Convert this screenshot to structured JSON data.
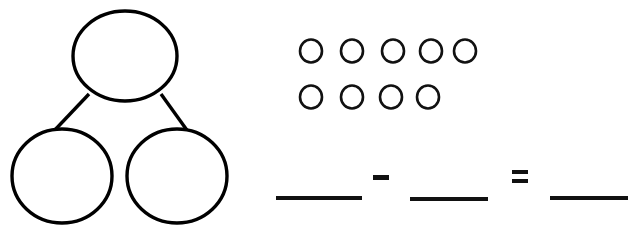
{
  "worksheet": {
    "title": "Number bond and subtraction sentence",
    "background_color": "#ffffff",
    "ink_color": "#000000",
    "width": 632,
    "height": 242
  },
  "number_bond": {
    "name": "number-bond",
    "description": "Number bond with one whole circle on top and two part circles below, all blank",
    "whole": {
      "label": "",
      "placeholder": "",
      "cx": 125,
      "cy": 56,
      "rx": 52,
      "ry": 45
    },
    "parts": [
      {
        "label": "",
        "placeholder": "",
        "cx": 62,
        "cy": 176,
        "rx": 50,
        "ry": 47
      },
      {
        "label": "",
        "placeholder": "",
        "cx": 177,
        "cy": 176,
        "rx": 50,
        "ry": 47
      }
    ],
    "connectors": [
      {
        "x1": 89,
        "y1": 94,
        "x2": 52,
        "y2": 133
      },
      {
        "x1": 161,
        "y1": 94,
        "x2": 189,
        "y2": 133
      }
    ]
  },
  "counters": {
    "name": "counter-group",
    "total_count": 9,
    "total_label": "9",
    "shape": "circle",
    "rows": [
      {
        "count": 5,
        "count_label": "5",
        "cy": 51,
        "rx": 11,
        "ry": 11.5,
        "cxs": [
          311,
          352,
          393,
          431,
          465
        ]
      },
      {
        "count": 4,
        "count_label": "4",
        "cy": 97,
        "rx": 11,
        "ry": 11.5,
        "cxs": [
          311,
          352,
          391,
          428
        ]
      }
    ]
  },
  "equation": {
    "name": "subtraction-sentence",
    "expression_label": "___ - ___ = ___",
    "operands": [
      {
        "name": "minuend-blank",
        "value": "",
        "placeholder": "",
        "x": 276,
        "y": 196,
        "width": 86,
        "height": 4
      },
      {
        "name": "subtrahend-blank",
        "value": "",
        "placeholder": "",
        "x": 410,
        "y": 197,
        "width": 78,
        "height": 4
      },
      {
        "name": "difference-blank",
        "value": "",
        "placeholder": "",
        "x": 550,
        "y": 196,
        "width": 78,
        "height": 4
      }
    ],
    "operators": [
      {
        "name": "minus-sign",
        "symbol": "-",
        "bars": [
          {
            "x": 373,
            "y": 175,
            "width": 16,
            "height": 5
          }
        ]
      },
      {
        "name": "equals-sign",
        "symbol": "=",
        "bars": [
          {
            "x": 512,
            "y": 170,
            "width": 16,
            "height": 4
          },
          {
            "x": 512,
            "y": 179,
            "width": 16,
            "height": 4
          }
        ]
      }
    ]
  }
}
